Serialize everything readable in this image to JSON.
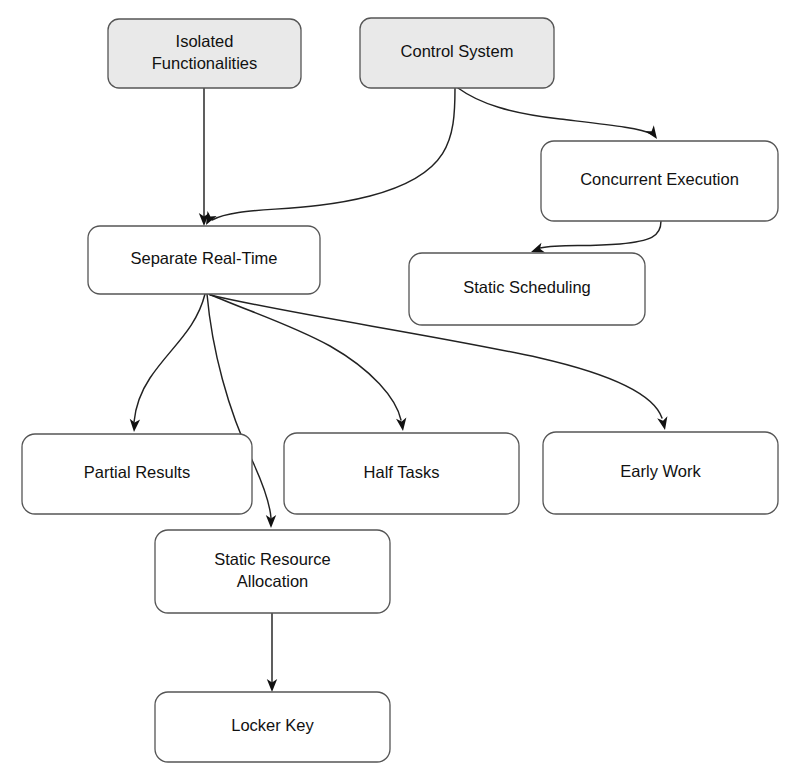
{
  "diagram": {
    "background_color": "#ffffff",
    "shaded_fill": "#e9e9e9",
    "plain_fill": "#ffffff",
    "stroke_color": "#555555",
    "edge_color": "#222222",
    "text_color": "#111111",
    "nodes": [
      {
        "id": "isolated-functionalities",
        "label_lines": [
          "Isolated",
          "Functionalities"
        ],
        "label": "Isolated Functionalities",
        "style": "shaded",
        "x": 108,
        "y": 19,
        "w": 193,
        "h": 69,
        "rx": 11
      },
      {
        "id": "control-system",
        "label_lines": [
          "Control System"
        ],
        "label": "Control System",
        "style": "shaded",
        "x": 360,
        "y": 18,
        "w": 194,
        "h": 70,
        "rx": 11
      },
      {
        "id": "concurrent-execution",
        "label_lines": [
          "Concurrent Execution"
        ],
        "label": "Concurrent Execution",
        "style": "plain",
        "x": 541,
        "y": 141,
        "w": 237,
        "h": 80,
        "rx": 13
      },
      {
        "id": "separate-real-time",
        "label_lines": [
          "Separate Real-Time"
        ],
        "label": "Separate Real-Time",
        "style": "plain",
        "x": 88,
        "y": 226,
        "w": 232,
        "h": 68,
        "rx": 12
      },
      {
        "id": "static-scheduling",
        "label_lines": [
          "Static Scheduling"
        ],
        "label": "Static Scheduling",
        "style": "plain",
        "x": 409,
        "y": 253,
        "w": 236,
        "h": 72,
        "rx": 13
      },
      {
        "id": "partial-results",
        "label_lines": [
          "Partial Results"
        ],
        "label": "Partial Results",
        "style": "plain",
        "x": 22,
        "y": 434,
        "w": 230,
        "h": 80,
        "rx": 13
      },
      {
        "id": "half-tasks",
        "label_lines": [
          "Half Tasks"
        ],
        "label": "Half Tasks",
        "style": "plain",
        "x": 284,
        "y": 433,
        "w": 235,
        "h": 81,
        "rx": 13
      },
      {
        "id": "early-work",
        "label_lines": [
          "Early Work"
        ],
        "label": "Early Work",
        "style": "plain",
        "x": 543,
        "y": 432,
        "w": 235,
        "h": 82,
        "rx": 13
      },
      {
        "id": "static-resource-allocation",
        "label_lines": [
          "Static Resource",
          "Allocation"
        ],
        "label": "Static Resource Allocation",
        "style": "plain",
        "x": 155,
        "y": 530,
        "w": 235,
        "h": 83,
        "rx": 13
      },
      {
        "id": "locker-key",
        "label_lines": [
          "Locker Key"
        ],
        "label": "Locker Key",
        "style": "plain",
        "x": 155,
        "y": 692,
        "w": 235,
        "h": 70,
        "rx": 13
      }
    ],
    "edges": [
      {
        "id": "isolated-functionalities-to-separate-real-time",
        "from": "isolated-functionalities",
        "to": "separate-real-time",
        "path": "M 204 88 L 204 219",
        "arrow": {
          "x": 204,
          "y": 226,
          "angle": 90
        }
      },
      {
        "id": "control-system-to-separate-real-time",
        "from": "control-system",
        "to": "separate-real-time",
        "path": "M 455 88 C 455 140 450 175 370 196 C 300 214 240 205 212 220",
        "arrow": {
          "x": 206,
          "y": 225,
          "angle": 118
        }
      },
      {
        "id": "control-system-to-concurrent-execution",
        "from": "control-system",
        "to": "concurrent-execution",
        "path": "M 458 88 C 480 104 510 113 560 119 C 610 125 640 128 652 134",
        "arrow": {
          "x": 657,
          "y": 139,
          "angle": 55
        }
      },
      {
        "id": "concurrent-execution-to-static-scheduling",
        "from": "concurrent-execution",
        "to": "static-scheduling",
        "path": "M 661 221 C 661 237 650 241 620 244 C 585 247 560 244 540 248",
        "arrow": {
          "x": 531,
          "y": 252,
          "angle": 160
        }
      },
      {
        "id": "separate-real-time-to-partial-results",
        "from": "separate-real-time",
        "to": "partial-results",
        "path": "M 205 294 C 196 330 170 348 150 378 C 138 396 135 412 134 422",
        "arrow": {
          "x": 134,
          "y": 432,
          "angle": 94
        }
      },
      {
        "id": "separate-real-time-to-static-resource-allocation",
        "from": "separate-real-time",
        "to": "static-resource-allocation",
        "path": "M 207 294 C 212 350 228 410 252 460 C 264 486 270 505 271 518",
        "arrow": {
          "x": 271,
          "y": 528,
          "angle": 90
        }
      },
      {
        "id": "separate-real-time-to-half-tasks",
        "from": "separate-real-time",
        "to": "half-tasks",
        "path": "M 209 294 C 245 310 290 324 330 346 C 372 370 396 398 401 420",
        "arrow": {
          "x": 403,
          "y": 431,
          "angle": 82
        }
      },
      {
        "id": "separate-real-time-to-early-work",
        "from": "separate-real-time",
        "to": "early-work",
        "path": "M 210 295 C 300 316 430 334 540 358 C 614 375 654 395 662 418",
        "arrow": {
          "x": 665,
          "y": 430,
          "angle": 78
        }
      },
      {
        "id": "static-resource-allocation-to-locker-key",
        "from": "static-resource-allocation",
        "to": "locker-key",
        "path": "M 272 613 L 272 684",
        "arrow": {
          "x": 272,
          "y": 692,
          "angle": 90
        }
      }
    ]
  }
}
